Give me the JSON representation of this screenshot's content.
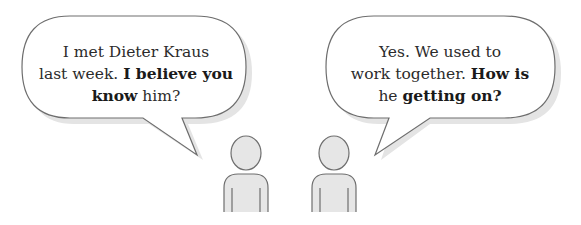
{
  "bubbles": [
    {
      "speaker": "left-person",
      "lines": [
        [
          {
            "text": "I met Dieter Kraus",
            "bold": false
          }
        ],
        [
          {
            "text": "last week. ",
            "bold": false
          },
          {
            "text": "I believe you",
            "bold": true
          }
        ],
        [
          {
            "text": "know",
            "bold": true
          },
          {
            "text": " him?",
            "bold": false
          }
        ]
      ]
    },
    {
      "speaker": "right-person",
      "lines": [
        [
          {
            "text": "Yes. We used to",
            "bold": false
          }
        ],
        [
          {
            "text": "work together. ",
            "bold": false
          },
          {
            "text": "How is",
            "bold": true
          }
        ],
        [
          {
            "text": "he ",
            "bold": false
          },
          {
            "text": "getting on?",
            "bold": true
          }
        ]
      ]
    }
  ],
  "figures": [
    {
      "name": "left-person",
      "icon": "person-icon"
    },
    {
      "name": "right-person",
      "icon": "person-icon"
    }
  ],
  "colors": {
    "outline": "#6e6e6e",
    "figure_fill": "#e6e6e6",
    "bubble_fill": "#ffffff",
    "shadow": "#e3e3e3",
    "text": "#2b2b2b"
  }
}
